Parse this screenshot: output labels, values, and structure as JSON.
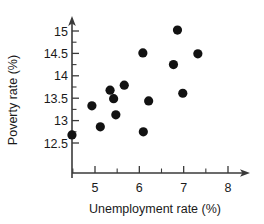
{
  "chart_data": {
    "type": "scatter",
    "title": "",
    "xlabel": "Unemployment rate (%)",
    "ylabel": "Poverty rate (%)",
    "xlim": [
      4.35,
      8.45
    ],
    "ylim": [
      12.2,
      15.25
    ],
    "xticks": [
      5,
      6,
      7,
      8
    ],
    "xtick_labels": [
      "5",
      "6",
      "7",
      "8"
    ],
    "x_minor_ticks": [
      4.5,
      5.5,
      6.5,
      7.5
    ],
    "yticks": [
      12.5,
      13,
      13.5,
      14,
      14.5,
      15
    ],
    "ytick_labels": [
      "12.5",
      "13",
      "13.5",
      "14",
      "14.5",
      "15"
    ],
    "y_minor_ticks": [
      12.75,
      13.25,
      13.75,
      14.25,
      14.75
    ],
    "grid": false,
    "legend": null,
    "marker": "circle",
    "marker_color": "#121212",
    "marker_size": 4.6,
    "points": [
      {
        "x": 4.48,
        "y": 12.68
      },
      {
        "x": 4.93,
        "y": 13.33
      },
      {
        "x": 5.12,
        "y": 12.86
      },
      {
        "x": 5.34,
        "y": 13.68
      },
      {
        "x": 5.42,
        "y": 13.49
      },
      {
        "x": 5.47,
        "y": 13.13
      },
      {
        "x": 5.66,
        "y": 13.79
      },
      {
        "x": 6.08,
        "y": 14.51
      },
      {
        "x": 6.09,
        "y": 12.75
      },
      {
        "x": 6.21,
        "y": 13.44
      },
      {
        "x": 6.77,
        "y": 14.25
      },
      {
        "x": 6.86,
        "y": 15.02
      },
      {
        "x": 6.98,
        "y": 13.61
      },
      {
        "x": 7.32,
        "y": 14.49
      }
    ]
  }
}
